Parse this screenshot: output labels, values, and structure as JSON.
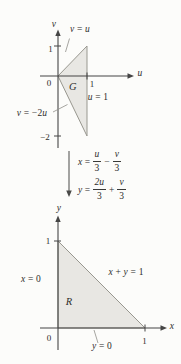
{
  "colors": {
    "background": "#fcfcfa",
    "region_fill": "#e8e7e3",
    "region_edge": "#98978f",
    "axis": "#454545",
    "text": "#2e2d2b",
    "leader_line": "#8f8e89"
  },
  "uv_plane": {
    "v_axis_label": "v",
    "u_axis_label": "u",
    "origin_label": "0",
    "v1_tick_label": "1",
    "u1_tick_label": "1",
    "vneg2_tick_label": "−2",
    "region_label": "G",
    "line_vu": {
      "p1": "v",
      "p2": " = ",
      "p3": "u"
    },
    "line_u1": {
      "p1": "u",
      "p2": " = 1"
    },
    "line_vneg2u": {
      "p1": "v",
      "p2": " = −2",
      "p3": "u"
    }
  },
  "transform": {
    "eq1": {
      "lhs": "x",
      "eq": "=",
      "num1": "u",
      "den1": "3",
      "op": "−",
      "num2": "v",
      "den2": "3"
    },
    "eq2": {
      "lhs": "y",
      "eq": "=",
      "num1": "2u",
      "den1": "3",
      "op": "+",
      "num2": "v",
      "den2": "3"
    }
  },
  "xy_plane": {
    "y_axis_label": "y",
    "x_axis_label": "x",
    "origin_label": "0",
    "y1_tick_label": "1",
    "x1_tick_label": "1",
    "region_label": "R",
    "line_x0": {
      "p1": "x",
      "p2": " = 0"
    },
    "line_xy1": {
      "p1": "x",
      "p2": " + ",
      "p3": "y",
      "p4": " = 1"
    },
    "line_y0": {
      "p1": "y",
      "p2": " = 0"
    }
  },
  "geometry": {
    "region_G_vertices_uv": [
      [
        0,
        0
      ],
      [
        1,
        1
      ],
      [
        1,
        -2
      ]
    ],
    "region_R_vertices_xy": [
      [
        0,
        0
      ],
      [
        1,
        0
      ],
      [
        0,
        1
      ]
    ]
  }
}
